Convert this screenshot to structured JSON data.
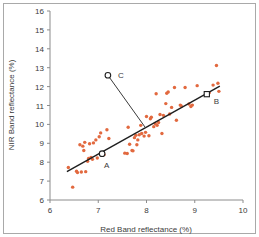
{
  "chart_data": {
    "type": "scatter",
    "title": "",
    "xlabel": "Red Band reflectance (%)",
    "ylabel": "NIR Band reflectance (%)",
    "xlim": [
      6,
      10
    ],
    "ylim": [
      6,
      16
    ],
    "xticks": [
      6,
      7,
      8,
      9,
      10
    ],
    "yticks": [
      6,
      7,
      8,
      9,
      10,
      11,
      12,
      13,
      14,
      15,
      16
    ],
    "xtick_labels": [
      "6",
      "7",
      "8",
      "9",
      "10"
    ],
    "ytick_labels": [
      "6",
      "7",
      "8",
      "9",
      "10",
      "11",
      "12",
      "13",
      "14",
      "15",
      "16"
    ],
    "grid": false,
    "legend": false,
    "point_color": "#e2693f",
    "line_color": "#1f1f1f",
    "axis_color": "#8c8c8c",
    "series": [
      {
        "name": "observations",
        "marker": "circle",
        "color": "#e2693f",
        "x": [
          6.38,
          6.47,
          6.55,
          6.57,
          6.62,
          6.65,
          6.68,
          6.7,
          6.72,
          6.74,
          6.78,
          6.8,
          6.82,
          6.85,
          6.88,
          6.9,
          6.95,
          6.98,
          7.02,
          7.05,
          7.08,
          7.12,
          7.18,
          7.22,
          7.55,
          7.6,
          7.62,
          7.65,
          7.7,
          7.72,
          7.75,
          7.78,
          7.8,
          7.82,
          7.85,
          7.88,
          7.9,
          7.95,
          7.98,
          8.0,
          8.05,
          8.08,
          8.1,
          8.15,
          8.18,
          8.2,
          8.22,
          8.25,
          8.28,
          8.32,
          8.35,
          8.4,
          8.42,
          8.45,
          8.48,
          8.52,
          8.58,
          8.62,
          8.7,
          8.72,
          8.8,
          8.88,
          8.92,
          8.95,
          9.05,
          9.25,
          9.3,
          9.38,
          9.45,
          9.48,
          9.5
        ],
        "y": [
          7.72,
          6.68,
          7.52,
          7.45,
          8.92,
          7.48,
          8.85,
          8.62,
          9.05,
          7.5,
          8.05,
          8.2,
          8.98,
          8.25,
          8.15,
          9.02,
          9.18,
          8.22,
          9.35,
          9.55,
          8.42,
          8.4,
          9.72,
          9.25,
          8.48,
          8.46,
          9.85,
          8.95,
          8.62,
          8.6,
          9.3,
          9.42,
          8.92,
          9.18,
          9.45,
          9.95,
          9.52,
          9.38,
          9.58,
          10.42,
          9.4,
          10.3,
          10.38,
          9.88,
          10.05,
          11.62,
          9.95,
          10.1,
          10.52,
          9.52,
          10.48,
          11.1,
          11.65,
          11.72,
          10.55,
          10.9,
          11.95,
          10.22,
          11.02,
          10.98,
          11.95,
          11.08,
          10.95,
          11.02,
          12.05,
          11.6,
          11.68,
          12.08,
          13.12,
          12.18,
          11.75
        ]
      }
    ],
    "regression_line": {
      "name": "fitted-regression-line",
      "x_start": 6.35,
      "y_start": 7.5,
      "x_end": 9.52,
      "y_end": 12.02
    },
    "annotated_points": [
      {
        "label": "A",
        "x": 7.08,
        "y": 8.45,
        "marker": "open-circle",
        "label_dx": 2,
        "label_dy": 14
      },
      {
        "label": "B",
        "x": 9.25,
        "y": 11.6,
        "marker": "open-square",
        "label_dx": 7,
        "label_dy": 10
      },
      {
        "label": "C",
        "x": 7.2,
        "y": 12.6,
        "marker": "open-circle",
        "label_dx": 10,
        "label_dy": 3
      }
    ],
    "residual_segment": {
      "name": "perpendicular-residual-C",
      "x_start": 7.2,
      "y_start": 12.6,
      "x_end": 7.98,
      "y_end": 9.82
    }
  }
}
